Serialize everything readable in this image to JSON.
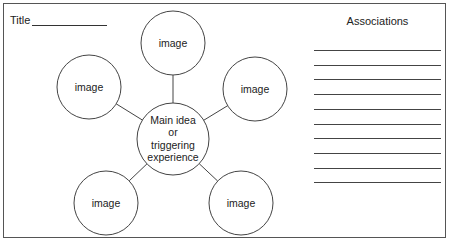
{
  "worksheet": {
    "title_label": "Title",
    "associations_heading": "Associations",
    "association_line_count": 10
  },
  "diagram": {
    "center": {
      "label_lines": [
        "Main idea",
        "or",
        "triggering",
        "experience"
      ],
      "cx": 173,
      "cy": 139,
      "r": 36
    },
    "nodes": [
      {
        "id": "top",
        "label": "image",
        "cx": 173,
        "cy": 43,
        "r": 32
      },
      {
        "id": "upper-left",
        "label": "image",
        "cx": 89,
        "cy": 87,
        "r": 32
      },
      {
        "id": "upper-right",
        "label": "image",
        "cx": 255,
        "cy": 89,
        "r": 32
      },
      {
        "id": "lower-left",
        "label": "image",
        "cx": 106,
        "cy": 203,
        "r": 32
      },
      {
        "id": "lower-right",
        "label": "image",
        "cx": 241,
        "cy": 203,
        "r": 32
      }
    ],
    "stroke_color": "#444444"
  }
}
